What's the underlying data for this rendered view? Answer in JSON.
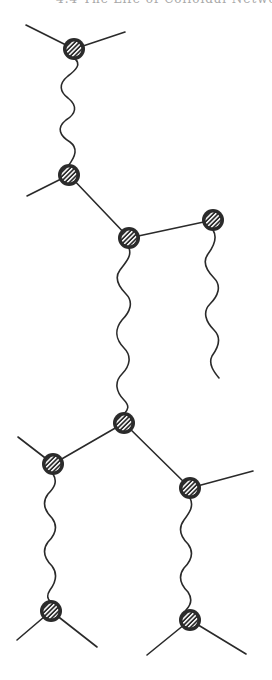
{
  "header": {
    "text": "4.4  The Life of Colloidal Networks"
  },
  "diagram": {
    "type": "polymer-network-schematic",
    "colors": {
      "ink": "#2a2a2a",
      "node_fill": "#2b2b2b",
      "hatch": "#ffffff",
      "background": "#ffffff"
    },
    "nodes": [
      {
        "id": "n1",
        "x": 74,
        "y": 49
      },
      {
        "id": "n2",
        "x": 69,
        "y": 175
      },
      {
        "id": "n3",
        "x": 129,
        "y": 238
      },
      {
        "id": "n4",
        "x": 213,
        "y": 220
      },
      {
        "id": "n5",
        "x": 124,
        "y": 423
      },
      {
        "id": "n6",
        "x": 53,
        "y": 464
      },
      {
        "id": "n7",
        "x": 190,
        "y": 488
      },
      {
        "id": "n8",
        "x": 51,
        "y": 611
      },
      {
        "id": "n9",
        "x": 190,
        "y": 620
      }
    ],
    "straight_bonds": [
      {
        "from": "n1",
        "to_point": [
          26,
          25
        ]
      },
      {
        "from": "n1",
        "to_point": [
          125,
          32
        ]
      },
      {
        "from": "n2",
        "to_point": [
          27,
          196
        ]
      },
      {
        "from": "n2",
        "to": "n3"
      },
      {
        "from": "n3",
        "to": "n4"
      },
      {
        "from": "n5",
        "to": "n6"
      },
      {
        "from": "n5",
        "to": "n7"
      },
      {
        "from": "n6",
        "to_point": [
          18,
          437
        ]
      },
      {
        "from": "n7",
        "to_point": [
          253,
          471
        ]
      },
      {
        "from": "n8",
        "to_point": [
          17,
          640
        ]
      },
      {
        "from": "n8",
        "to_point": [
          97,
          647
        ]
      },
      {
        "from": "n9",
        "to_point": [
          147,
          655
        ]
      },
      {
        "from": "n9",
        "to_point": [
          246,
          654
        ]
      }
    ],
    "wavy_chains": [
      {
        "from": "n1",
        "to": "n2"
      },
      {
        "from": "n3",
        "to": "n5"
      },
      {
        "from": "n4",
        "to_point": [
          219,
          378
        ]
      },
      {
        "from": "n6",
        "to": "n8"
      },
      {
        "from": "n7",
        "to": "n9"
      }
    ],
    "node_count": 9
  }
}
